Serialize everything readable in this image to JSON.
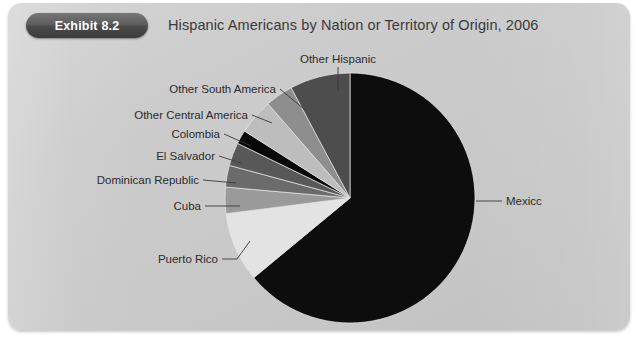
{
  "card": {
    "badge_label": "Exhibit 8.2",
    "title": "Hispanic Americans by Nation or Territory of Origin, 2006",
    "background_color": "#cbcbcb",
    "badge_color": "#4a4a4a"
  },
  "chart_data": {
    "type": "pie",
    "title": "Hispanic Americans by Nation or Territory of Origin, 2006",
    "subtitle": "",
    "xlabel": "",
    "ylabel": "",
    "legend_position": "none",
    "labels_position": "outside-with-leader-lines",
    "grid": false,
    "start_angle_deg": 0,
    "direction": "clockwise",
    "categories": [
      "Mexico",
      "Puerto Rico",
      "Cuba",
      "Dominican Republic",
      "El  Salvador",
      "Colombia",
      "Other Central America",
      "Other South America",
      "Other Hispanic"
    ],
    "values": [
      64.0,
      9.0,
      3.4,
      2.8,
      3.0,
      1.8,
      4.6,
      3.6,
      7.8
    ],
    "unit": "percent",
    "colors": [
      "#0d0d0d",
      "#e3e3e3",
      "#9a9a9a",
      "#6b6b6b",
      "#585858",
      "#080808",
      "#bdbdbd",
      "#8e8e8e",
      "#4d4d4d"
    ],
    "slices": [
      {
        "label": "Mexico",
        "value": 64.0,
        "color": "#0d0d0d",
        "label_side": "right"
      },
      {
        "label": "Puerto Rico",
        "value": 9.0,
        "color": "#e3e3e3",
        "label_side": "left"
      },
      {
        "label": "Cuba",
        "value": 3.4,
        "color": "#9a9a9a",
        "label_side": "left"
      },
      {
        "label": "Dominican Republic",
        "value": 2.8,
        "color": "#6b6b6b",
        "label_side": "left"
      },
      {
        "label": "El  Salvador",
        "value": 3.0,
        "color": "#585858",
        "label_side": "left"
      },
      {
        "label": "Colombia",
        "value": 1.8,
        "color": "#080808",
        "label_side": "left"
      },
      {
        "label": "Other Central America",
        "value": 4.6,
        "color": "#bdbdbd",
        "label_side": "left"
      },
      {
        "label": "Other South America",
        "value": 3.6,
        "color": "#8e8e8e",
        "label_side": "left"
      },
      {
        "label": "Other Hispanic",
        "value": 7.8,
        "color": "#4d4d4d",
        "label_side": "top"
      }
    ]
  },
  "labels": {
    "mexico": "Mexicc",
    "puerto_rico": "Puerto Rico",
    "cuba": "Cuba",
    "dominican_republic": "Dominican Republic",
    "el_salvador": "El  Salvador",
    "colombia": "Colombia",
    "other_central_america": "Other Central America",
    "other_south_america": "Other South America",
    "other_hispanic": "Other Hispanic"
  }
}
